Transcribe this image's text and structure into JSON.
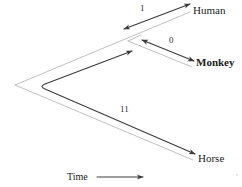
{
  "figure": {
    "type": "phylogenetic-tree-diagram",
    "title": "",
    "background_color": "#ffffff",
    "tree_line_color": "#b9b9b9",
    "arrow_color": "#3a3a3a",
    "axis_color": "#3a3a3a"
  },
  "taxa": [
    {
      "id": "human",
      "label": "Human",
      "bold": false
    },
    {
      "id": "monkey",
      "label": "Monkey",
      "bold": true
    },
    {
      "id": "horse",
      "label": "Horse",
      "bold": false
    }
  ],
  "distances": [
    {
      "id": "human",
      "label": "1",
      "value": 1
    },
    {
      "id": "monkey",
      "label": "0",
      "value": 0
    },
    {
      "id": "horse",
      "label": "11",
      "value": 11
    }
  ],
  "axis": {
    "label": "Time",
    "direction": "right",
    "arrow_glyph": "arrow-right"
  },
  "icons": {
    "arrow_head": "arrowhead-icon",
    "double_arrow": "double-arrow-icon"
  }
}
